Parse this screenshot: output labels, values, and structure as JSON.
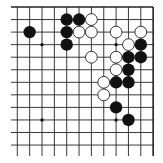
{
  "game": "go",
  "view": "upper-right portion of 19x19 board",
  "board": {
    "columns_shown": 12,
    "rows_shown": 12,
    "edges": [
      "top",
      "right"
    ],
    "line_color": "#222222",
    "background": "#ffffff"
  },
  "star_points": [
    {
      "col": 2,
      "row": 3
    },
    {
      "col": 8,
      "row": 3
    },
    {
      "col": 2,
      "row": 9
    },
    {
      "col": 8,
      "row": 9
    }
  ],
  "stones": {
    "black": [
      {
        "col": 1,
        "row": 2
      },
      {
        "col": 4,
        "row": 1
      },
      {
        "col": 5,
        "row": 1
      },
      {
        "col": 4,
        "row": 2
      },
      {
        "col": 4,
        "row": 3
      },
      {
        "col": 10,
        "row": 3
      },
      {
        "col": 9,
        "row": 4
      },
      {
        "col": 10,
        "row": 4
      },
      {
        "col": 9,
        "row": 5
      },
      {
        "col": 8,
        "row": 6
      },
      {
        "col": 9,
        "row": 6
      },
      {
        "col": 8,
        "row": 8
      },
      {
        "col": 9,
        "row": 9
      }
    ],
    "white": [
      {
        "col": 6,
        "row": 1
      },
      {
        "col": 5,
        "row": 2
      },
      {
        "col": 6,
        "row": 2
      },
      {
        "col": 8,
        "row": 2
      },
      {
        "col": 10,
        "row": 2
      },
      {
        "col": 9,
        "row": 3
      },
      {
        "col": 6,
        "row": 4
      },
      {
        "col": 8,
        "row": 4
      },
      {
        "col": 8,
        "row": 5
      },
      {
        "col": 7,
        "row": 6
      },
      {
        "col": 7,
        "row": 7
      }
    ]
  },
  "colors": {
    "black_stone": "#111111",
    "white_stone": "#ffffff",
    "white_stone_outline": "#222222"
  }
}
